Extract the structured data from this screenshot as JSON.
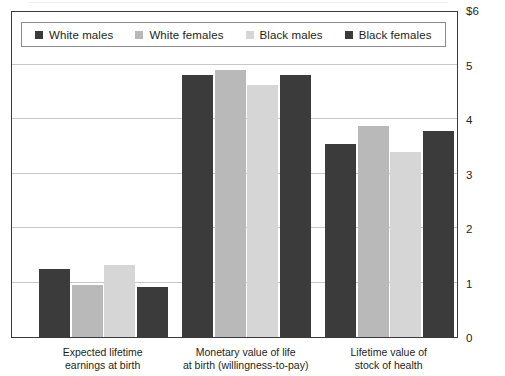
{
  "chart_data": {
    "type": "bar",
    "title": "",
    "subtitle": "",
    "xlabel": "",
    "ylabel": "",
    "ylim": [
      0,
      6
    ],
    "yticks": [
      0,
      1,
      2,
      3,
      4,
      5,
      6
    ],
    "ytick_labels": [
      "0",
      "1",
      "2",
      "3",
      "4",
      "5",
      "$6"
    ],
    "grid": true,
    "legend_position": "top-left",
    "categories": [
      "Expected lifetime\nearnings at birth",
      "Monetary value of life\nat birth (willingness-to-pay)",
      "Lifetime value of\nstock of health"
    ],
    "series": [
      {
        "name": "White males",
        "color": "#3b3b3b",
        "values": [
          1.25,
          4.8,
          3.55
        ]
      },
      {
        "name": "White females",
        "color": "#b9b9b9",
        "values": [
          0.95,
          4.9,
          3.87
        ]
      },
      {
        "name": "Black males",
        "color": "#d6d6d6",
        "values": [
          1.32,
          4.62,
          3.4
        ]
      },
      {
        "name": "Black females",
        "color": "#3b3b3b",
        "values": [
          0.92,
          4.8,
          3.78
        ]
      }
    ]
  },
  "legend": {
    "items": [
      {
        "label": "White males",
        "swatch_color": "#3b3b3b"
      },
      {
        "label": "White females",
        "swatch_color": "#b9b9b9"
      },
      {
        "label": "Black males",
        "swatch_color": "#d6d6d6"
      },
      {
        "label": "Black females",
        "swatch_color": "#3b3b3b"
      }
    ]
  },
  "axes": {
    "y_tick_labels": [
      "$6",
      "5",
      "4",
      "3",
      "2",
      "1",
      "0"
    ],
    "x_group_labels": [
      "Expected lifetime\nearnings at birth",
      "Monetary value of life\nat birth (willingness-to-pay)",
      "Lifetime value of\nstock of health"
    ]
  }
}
